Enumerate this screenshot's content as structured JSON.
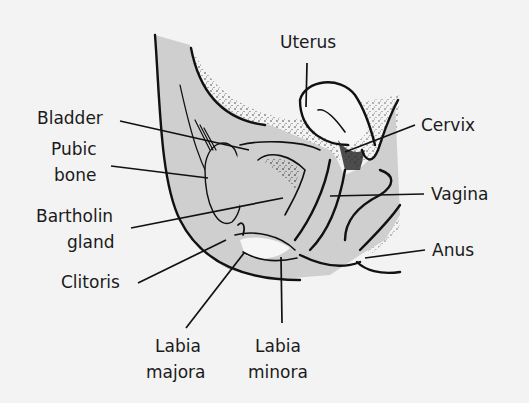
{
  "diagram": {
    "type": "anatomical-illustration",
    "colors": {
      "background": "#f3f3f3",
      "tissue_fill": "#cfcfcf",
      "outline": "#111111",
      "text": "#1a1a1a"
    },
    "labels": [
      {
        "id": "uterus",
        "lines": [
          "Uterus"
        ]
      },
      {
        "id": "bladder",
        "lines": [
          "Bladder"
        ]
      },
      {
        "id": "cervix",
        "lines": [
          "Cervix"
        ]
      },
      {
        "id": "pubic-bone",
        "lines": [
          "Pubic",
          "bone"
        ]
      },
      {
        "id": "vagina",
        "lines": [
          "Vagina"
        ]
      },
      {
        "id": "bartholin-gland",
        "lines": [
          "Bartholin",
          "gland"
        ]
      },
      {
        "id": "anus",
        "lines": [
          "Anus"
        ]
      },
      {
        "id": "clitoris",
        "lines": [
          "Clitoris"
        ]
      },
      {
        "id": "labia-majora",
        "lines": [
          "Labia",
          "majora"
        ]
      },
      {
        "id": "labia-minora",
        "lines": [
          "Labia",
          "minora"
        ]
      }
    ]
  }
}
